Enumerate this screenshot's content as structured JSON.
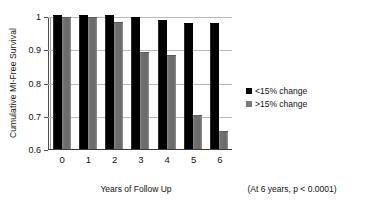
{
  "chart_data": {
    "type": "bar",
    "title": "",
    "xlabel": "Years of Follow Up",
    "ylabel": "Cumulative MI-Free Survival",
    "categories": [
      "0",
      "1",
      "2",
      "3",
      "4",
      "5",
      "6"
    ],
    "series": [
      {
        "name": "<15% change",
        "color": "#000000",
        "values": [
          1.0,
          1.0,
          1.0,
          0.995,
          0.985,
          0.975,
          0.975
        ]
      },
      {
        "name": ">15% change",
        "color": "#6f6f6f",
        "values": [
          0.995,
          0.995,
          0.98,
          0.89,
          0.88,
          0.7,
          0.65
        ]
      }
    ],
    "ylim": [
      0.6,
      1.0
    ],
    "yticks": [
      "0.6",
      "0.7",
      "0.8",
      "0.9",
      "1"
    ],
    "ytick_values": [
      0.6,
      0.7,
      0.8,
      0.9,
      1.0
    ],
    "grid": true,
    "legend_position": "right",
    "annotation": "(At 6 years, p < 0.0001)"
  },
  "legend": {
    "items": [
      {
        "label": "<15% change",
        "swatch": "dark-square-icon"
      },
      {
        "label": ">15% change",
        "swatch": "gray-square-icon"
      }
    ]
  }
}
